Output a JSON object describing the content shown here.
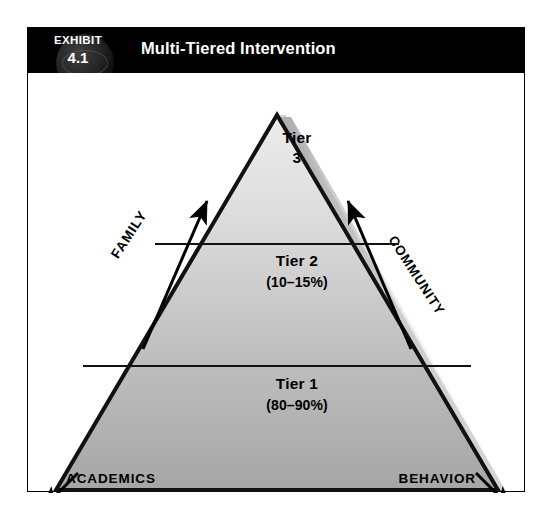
{
  "figure": {
    "exhibit_word": "EXHIBIT",
    "exhibit_number": "4.1",
    "title": "Multi-Tiered Intervention"
  },
  "colors": {
    "header_background": "#000000",
    "header_text": "#ffffff",
    "frame_border": "#000000",
    "pyramid_outline": "#000000",
    "pyramid_fill_top": "#e4e4e4",
    "pyramid_fill_bottom": "#a9a9a9",
    "shadow": "#b3b3b3",
    "page_background": "#ffffff"
  },
  "pyramid": {
    "tiers": [
      {
        "id": "tier-3",
        "name_line1": "Tier",
        "name_line2": "3",
        "name": "Tier 3",
        "percent": ""
      },
      {
        "id": "tier-2",
        "name": "Tier 2",
        "percent": "(10–15%)"
      },
      {
        "id": "tier-1",
        "name": "Tier 1",
        "percent": "(80–90%)"
      }
    ]
  },
  "axes": {
    "left_side": "FAMILY",
    "right_side": "COMMUNITY",
    "bottom_left": "ACADEMICS",
    "bottom_right": "BEHAVIOR"
  },
  "icons": {
    "globe": "globe-icon",
    "left_up_arrow": "arrow-up-right-icon",
    "right_up_arrow": "arrow-up-left-icon",
    "academics_arrow": "arrow-down-left-icon",
    "behavior_arrow": "arrow-down-right-icon"
  }
}
